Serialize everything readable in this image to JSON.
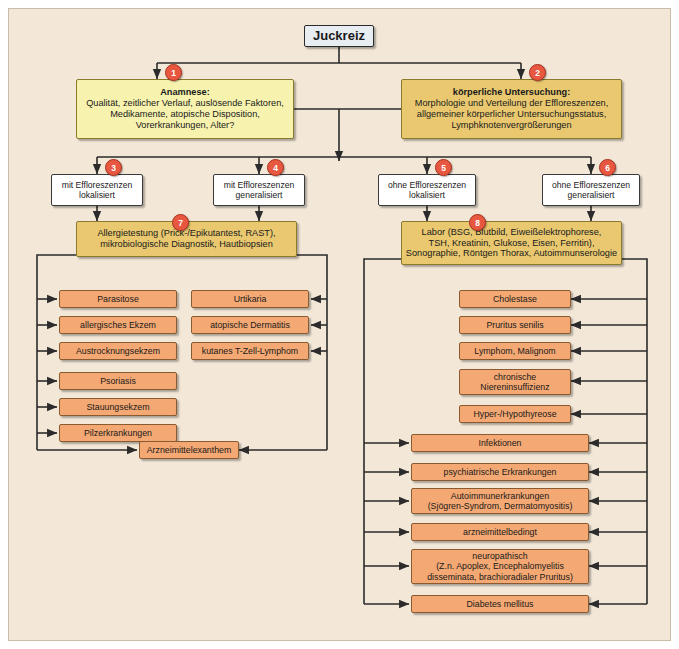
{
  "diagram": {
    "title": "Juckreiz",
    "root": {
      "label": "Juckreiz"
    },
    "steps": [
      {
        "badge": "1",
        "title": "Anamnese:",
        "lines": [
          "Qualität, zeitlicher Verlauf, auslösende Faktoren,",
          "Medikamente, atopische Disposition,",
          "Vorerkrankungen, Alter?"
        ]
      },
      {
        "badge": "2",
        "title": "körperliche Untersuchung:",
        "lines": [
          "Morphologie und Verteilung der Effloreszenzen,",
          "allgemeiner körperlicher Untersuchungsstatus,",
          "Lymphknotenvergrößerungen"
        ]
      }
    ],
    "branches": [
      {
        "badge": "3",
        "lines": [
          "mit Effloreszenzen",
          "lokalisiert"
        ]
      },
      {
        "badge": "4",
        "lines": [
          "mit Effloreszenzen",
          "generalisiert"
        ]
      },
      {
        "badge": "5",
        "lines": [
          "ohne Effloreszenzen",
          "lokalisiert"
        ]
      },
      {
        "badge": "6",
        "lines": [
          "ohne Effloreszenzen",
          "generalisiert"
        ]
      }
    ],
    "workups": [
      {
        "badge": "7",
        "lines": [
          "Allergietestung (Prick-/Epikutantest, RAST),",
          "mikrobiologische Diagnostik, Hautbiopsien"
        ]
      },
      {
        "badge": "8",
        "lines": [
          "Labor (BSG, Blutbild, Eiweißelektrophorese,",
          "TSH, Kreatinin, Glukose, Eisen, Ferritin),",
          "Sonographie, Röntgen Thorax, Autoimmunserologie"
        ]
      }
    ],
    "left_column_a": [
      {
        "lines": [
          "Parasitose"
        ]
      },
      {
        "lines": [
          "allergisches Ekzem"
        ]
      },
      {
        "lines": [
          "Austrocknungsekzem"
        ]
      },
      {
        "lines": [
          "Psoriasis"
        ]
      },
      {
        "lines": [
          "Stauungsekzem"
        ]
      },
      {
        "lines": [
          "Pilzerkrankungen"
        ]
      }
    ],
    "left_column_b": [
      {
        "lines": [
          "Urtikaria"
        ]
      },
      {
        "lines": [
          "atopische Dermatitis"
        ]
      },
      {
        "lines": [
          "kutanes T-Zell-Lymphom"
        ]
      }
    ],
    "shared_left": {
      "lines": [
        "Arzneimittelexanthem"
      ]
    },
    "right_narrow": [
      {
        "lines": [
          "Cholestase"
        ]
      },
      {
        "lines": [
          "Pruritus senilis"
        ]
      },
      {
        "lines": [
          "Lymphom, Malignom"
        ]
      },
      {
        "lines": [
          "chronische",
          "Niereninsuffizienz"
        ]
      },
      {
        "lines": [
          "Hyper-/Hypothyreose"
        ]
      }
    ],
    "right_wide": [
      {
        "lines": [
          "Infektionen"
        ]
      },
      {
        "lines": [
          "psychiatrische Erkrankungen"
        ]
      },
      {
        "lines": [
          "Autoimmunerkrankungen",
          "(Sjögren-Syndrom, Dermatomyositis)"
        ]
      },
      {
        "lines": [
          "arzneimittelbedingt"
        ]
      },
      {
        "lines": [
          "neuropathisch",
          "(Z.n. Apoplex, Encephalomyelitis",
          "disseminata, brachioradialer Pruritus)"
        ]
      },
      {
        "lines": [
          "Diabetes mellitus"
        ]
      }
    ],
    "colors": {
      "background": "#f3e8d8",
      "root_box": "#e8edf2",
      "anamnese_box": "#f7f2ae",
      "untersuchung_box": "#e9c870",
      "branch_box": "#ffffff",
      "leaf_box": "#f4a873",
      "badge": "#e8573f",
      "line": "#2b2b2b"
    }
  }
}
